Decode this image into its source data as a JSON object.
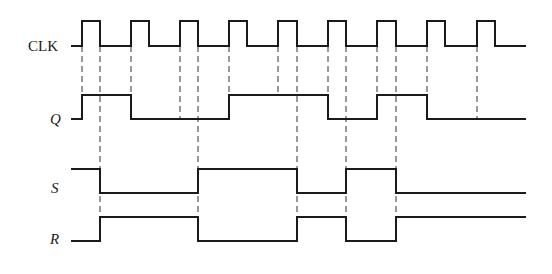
{
  "diagram": {
    "type": "timing-diagram",
    "signals": [
      {
        "name": "CLK",
        "label": "CLK",
        "italic": false,
        "label_pos": [
          28,
          51
        ],
        "y_high": 21,
        "y_low": 46,
        "start_x": 71,
        "end_x": 526,
        "initial": 0,
        "transitions": [
          82,
          100,
          131,
          149,
          180,
          198,
          229,
          247,
          278,
          297,
          328,
          346,
          377,
          396,
          427,
          445,
          477,
          495
        ]
      },
      {
        "name": "Q",
        "label": "Q",
        "italic": true,
        "label_pos": [
          50,
          124
        ],
        "y_high": 95,
        "y_low": 119,
        "start_x": 71,
        "end_x": 526,
        "initial": 0,
        "transitions": [
          82,
          131,
          229,
          328,
          377,
          427
        ]
      },
      {
        "name": "S",
        "label": "S",
        "italic": true,
        "label_pos": [
          51,
          193
        ],
        "y_high": 169,
        "y_low": 193,
        "start_x": 71,
        "end_x": 526,
        "initial": 1,
        "transitions": [
          100,
          198,
          297,
          346,
          396
        ]
      },
      {
        "name": "R",
        "label": "R",
        "italic": true,
        "label_pos": [
          50,
          244
        ],
        "y_high": 217,
        "y_low": 241,
        "start_x": 71,
        "end_x": 526,
        "initial": 0,
        "transitions": [
          100,
          198,
          297,
          346,
          396
        ]
      }
    ],
    "guides": [
      {
        "x": 82,
        "y1": 46,
        "y2": 119
      },
      {
        "x": 100,
        "y1": 46,
        "y2": 241
      },
      {
        "x": 131,
        "y1": 46,
        "y2": 119
      },
      {
        "x": 180,
        "y1": 46,
        "y2": 119
      },
      {
        "x": 198,
        "y1": 46,
        "y2": 241
      },
      {
        "x": 229,
        "y1": 46,
        "y2": 119
      },
      {
        "x": 278,
        "y1": 46,
        "y2": 95
      },
      {
        "x": 297,
        "y1": 46,
        "y2": 241
      },
      {
        "x": 328,
        "y1": 46,
        "y2": 119
      },
      {
        "x": 346,
        "y1": 46,
        "y2": 241
      },
      {
        "x": 377,
        "y1": 46,
        "y2": 119
      },
      {
        "x": 396,
        "y1": 46,
        "y2": 241
      },
      {
        "x": 427,
        "y1": 46,
        "y2": 119
      },
      {
        "x": 477,
        "y1": 46,
        "y2": 119
      }
    ],
    "colors": {
      "line": "#1a1a1a",
      "dash": "#333333",
      "background": "#ffffff"
    }
  }
}
